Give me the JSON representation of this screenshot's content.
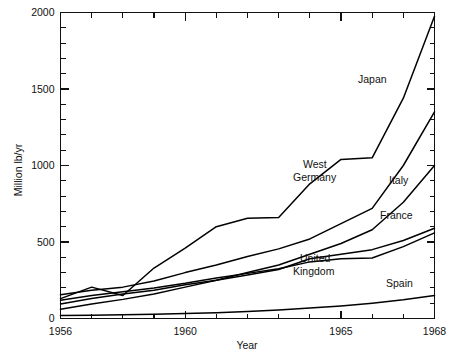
{
  "chart_data": {
    "type": "line",
    "title": "",
    "xlabel": "Year",
    "ylabel": "Million lb/yr",
    "xlim": [
      1956,
      1968
    ],
    "ylim": [
      0,
      2000
    ],
    "grid": false,
    "legend_position": "inline-annotations",
    "x_ticks_labeled": [
      "1956",
      "1960",
      "1965",
      "1968"
    ],
    "x_tick_values_labeled": [
      1956,
      1960,
      1965,
      1968
    ],
    "x_minor_tick_step": 1,
    "y_ticks_labeled": [
      "0",
      "500",
      "1000",
      "1500",
      "2000"
    ],
    "y_tick_values_labeled": [
      0,
      500,
      1000,
      1500,
      2000
    ],
    "y_minor_tick_step": 100,
    "x": [
      1956,
      1957,
      1958,
      1959,
      1960,
      1961,
      1962,
      1963,
      1964,
      1965,
      1966,
      1967,
      1968
    ],
    "series": [
      {
        "name": "Japan",
        "label": "Japan",
        "values": [
          130,
          205,
          150,
          330,
          460,
          600,
          655,
          660,
          880,
          1040,
          1050,
          1440,
          1975
        ]
      },
      {
        "name": "West Germany",
        "label": "West Germany",
        "values": [
          155,
          185,
          205,
          245,
          300,
          350,
          405,
          455,
          520,
          620,
          720,
          1000,
          1350
        ]
      },
      {
        "name": "Italy",
        "label": "Italy",
        "values": [
          60,
          95,
          125,
          160,
          205,
          250,
          300,
          350,
          420,
          490,
          580,
          760,
          1000
        ]
      },
      {
        "name": "France",
        "label": "France",
        "values": [
          95,
          130,
          160,
          185,
          220,
          250,
          285,
          320,
          390,
          420,
          450,
          510,
          590
        ]
      },
      {
        "name": "United Kingdom",
        "label": "United Kingdom",
        "values": [
          120,
          150,
          175,
          200,
          230,
          265,
          295,
          325,
          370,
          390,
          395,
          470,
          560
        ]
      },
      {
        "name": "Spain",
        "label": "Spain",
        "values": [
          20,
          22,
          25,
          28,
          32,
          38,
          45,
          55,
          68,
          82,
          100,
          122,
          150
        ]
      }
    ],
    "annotations": [
      {
        "text": "Japan",
        "x_px": 358,
        "y_px": 83,
        "anchor": "start"
      },
      {
        "text": "West",
        "x_px": 303,
        "y_px": 168,
        "anchor": "start"
      },
      {
        "text": "Germany",
        "x_px": 293,
        "y_px": 181,
        "anchor": "start"
      },
      {
        "text": "Italy",
        "x_px": 389,
        "y_px": 184,
        "anchor": "start"
      },
      {
        "text": "France",
        "x_px": 380,
        "y_px": 219,
        "anchor": "start"
      },
      {
        "text": "United",
        "x_px": 300,
        "y_px": 262,
        "anchor": "start"
      },
      {
        "text": "Kingdom",
        "x_px": 293,
        "y_px": 275,
        "anchor": "start"
      },
      {
        "text": "Spain",
        "x_px": 386,
        "y_px": 287,
        "anchor": "start"
      }
    ]
  },
  "axes": {
    "y_title": "Million lb/yr",
    "x_title": "Year",
    "y_labels": [
      "2000",
      "1500",
      "1000",
      "500",
      "0"
    ],
    "x_labels": [
      "1956",
      "1960",
      "1965",
      "1968"
    ]
  },
  "colors": {
    "line": "#000000",
    "axis": "#111111",
    "background": "#ffffff",
    "text": "#111111"
  }
}
